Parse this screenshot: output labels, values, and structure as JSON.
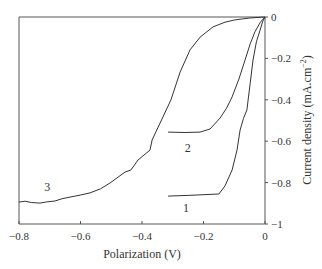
{
  "chart_data": {
    "type": "line",
    "title": "",
    "xlabel": "Polarization (V)",
    "ylabel": "Current density (mA.cm⁻²)",
    "ylabel_main": "Current density (mA.cm",
    "ylabel_sup": "−2",
    "ylabel_tail": ")",
    "xlim": [
      -0.8,
      0
    ],
    "ylim": [
      -1,
      0
    ],
    "grid": false,
    "legend": "none",
    "x_ticks": [
      {
        "value": -0.8,
        "label": "−0.8"
      },
      {
        "value": -0.6,
        "label": "−0.6"
      },
      {
        "value": -0.4,
        "label": "−0.4"
      },
      {
        "value": -0.2,
        "label": "−0.2"
      },
      {
        "value": 0,
        "label": "0"
      }
    ],
    "y_ticks": [
      {
        "value": 0,
        "label": "0"
      },
      {
        "value": -0.2,
        "label": "−0.2"
      },
      {
        "value": -0.4,
        "label": "−0.4"
      },
      {
        "value": -0.6,
        "label": "−0.6"
      },
      {
        "value": -0.8,
        "label": "−0.8"
      },
      {
        "value": -1,
        "label": "−1"
      }
    ],
    "series": [
      {
        "name": "1",
        "label_at": {
          "x": -0.257,
          "y": -0.94
        },
        "points": [
          [
            -0.315,
            -0.865
          ],
          [
            -0.25,
            -0.862
          ],
          [
            -0.15,
            -0.855
          ],
          [
            -0.13,
            -0.816
          ],
          [
            -0.107,
            -0.739
          ],
          [
            -0.091,
            -0.643
          ],
          [
            -0.081,
            -0.546
          ],
          [
            -0.07,
            -0.49
          ],
          [
            -0.059,
            -0.449
          ],
          [
            -0.048,
            -0.32
          ],
          [
            -0.039,
            -0.208
          ],
          [
            -0.028,
            -0.12
          ],
          [
            -0.016,
            -0.063
          ],
          [
            -0.007,
            -0.02
          ],
          [
            0,
            0
          ]
        ]
      },
      {
        "name": "2",
        "label_at": {
          "x": -0.251,
          "y": -0.65
        },
        "points": [
          [
            -0.315,
            -0.556
          ],
          [
            -0.26,
            -0.558
          ],
          [
            -0.211,
            -0.556
          ],
          [
            -0.179,
            -0.541
          ],
          [
            -0.146,
            -0.488
          ],
          [
            -0.125,
            -0.44
          ],
          [
            -0.107,
            -0.386
          ],
          [
            -0.085,
            -0.3
          ],
          [
            -0.065,
            -0.208
          ],
          [
            -0.048,
            -0.13
          ],
          [
            -0.033,
            -0.072
          ],
          [
            -0.015,
            -0.025
          ],
          [
            0,
            0
          ]
        ]
      },
      {
        "name": "3",
        "label_at": {
          "x": -0.708,
          "y": -0.84
        },
        "points": [
          [
            -0.8,
            -0.894
          ],
          [
            -0.78,
            -0.89
          ],
          [
            -0.76,
            -0.896
          ],
          [
            -0.732,
            -0.899
          ],
          [
            -0.71,
            -0.893
          ],
          [
            -0.683,
            -0.889
          ],
          [
            -0.66,
            -0.878
          ],
          [
            -0.634,
            -0.87
          ],
          [
            -0.6,
            -0.86
          ],
          [
            -0.569,
            -0.85
          ],
          [
            -0.535,
            -0.83
          ],
          [
            -0.504,
            -0.802
          ],
          [
            -0.455,
            -0.749
          ],
          [
            -0.436,
            -0.739
          ],
          [
            -0.413,
            -0.691
          ],
          [
            -0.374,
            -0.643
          ],
          [
            -0.367,
            -0.594
          ],
          [
            -0.341,
            -0.512
          ],
          [
            -0.306,
            -0.401
          ],
          [
            -0.276,
            -0.266
          ],
          [
            -0.244,
            -0.159
          ],
          [
            -0.211,
            -0.097
          ],
          [
            -0.169,
            -0.048
          ],
          [
            -0.13,
            -0.025
          ],
          [
            -0.098,
            -0.014
          ],
          [
            -0.05,
            -0.005
          ],
          [
            0,
            0
          ]
        ]
      }
    ]
  }
}
